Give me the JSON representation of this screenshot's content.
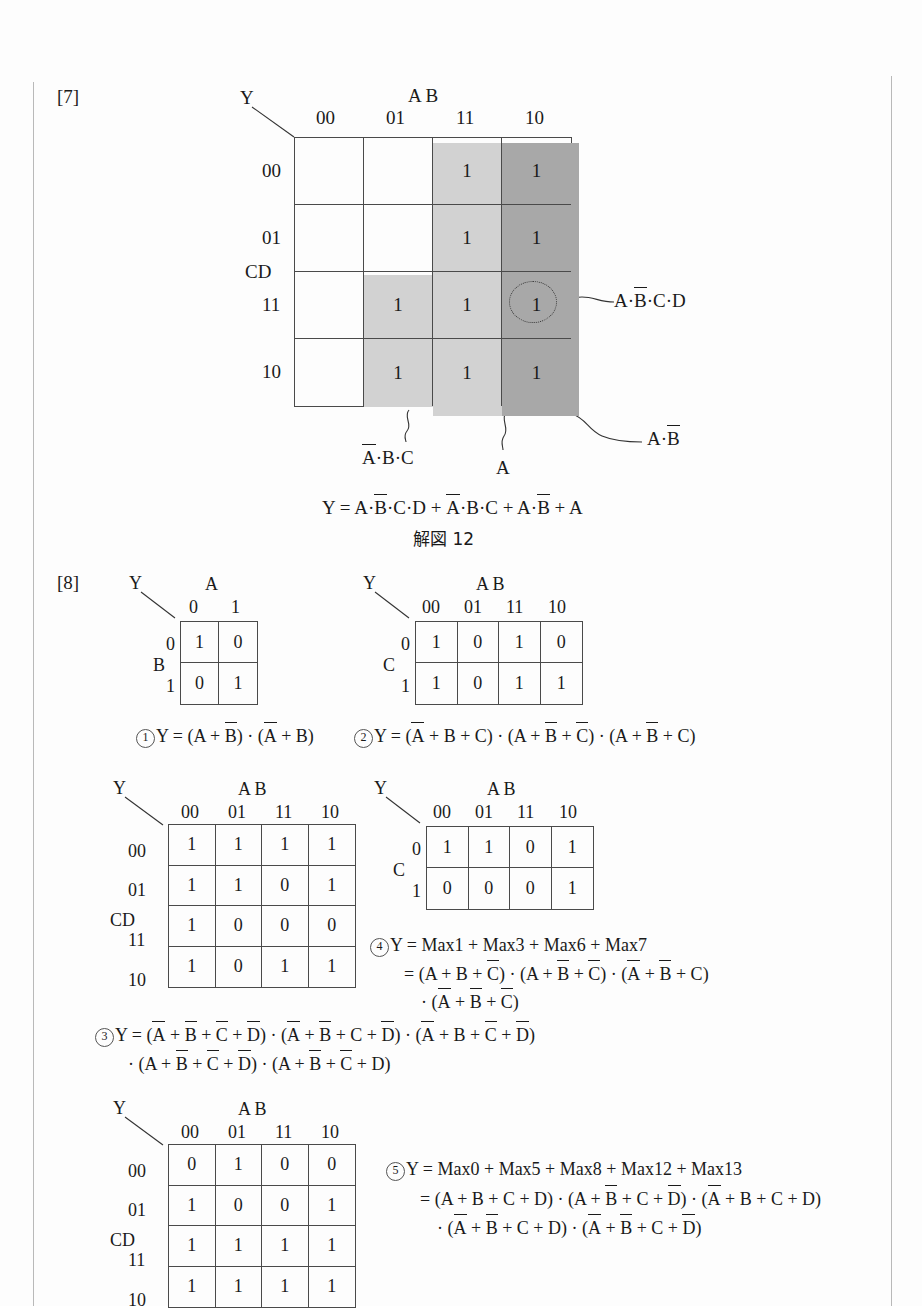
{
  "page": {
    "section7_tag": "[7]",
    "section8_tag": "[8]"
  },
  "map7": {
    "output_label": "Y",
    "col_group_label": "A B",
    "row_group_label": "CD",
    "col_headers": [
      "00",
      "01",
      "11",
      "10"
    ],
    "row_headers": [
      "00",
      "01",
      "11",
      "10"
    ],
    "cells": [
      [
        "",
        "",
        "1",
        "1"
      ],
      [
        "",
        "",
        "1",
        "1"
      ],
      [
        "",
        "1",
        "1",
        "1"
      ],
      [
        "",
        "1",
        "1",
        "1"
      ]
    ],
    "annotations": {
      "circled_term": "A·B̄·C·D",
      "a_bbar": "A·B̄",
      "abar_b_c": "Ā·B·C",
      "a": "A"
    },
    "result": "Y = A·B̄·C·D + Ā·B·C + A·B̄ + A",
    "caption": "解図 12"
  },
  "map1": {
    "output_label": "Y",
    "col_group_label": "A",
    "row_group_label": "B",
    "col_headers": [
      "0",
      "1"
    ],
    "row_headers": [
      "0",
      "1"
    ],
    "cells": [
      [
        "1",
        "0"
      ],
      [
        "0",
        "1"
      ]
    ],
    "number": "①",
    "equation": "Y = (A + B̄) · (Ā + B)"
  },
  "map2": {
    "output_label": "Y",
    "col_group_label": "A B",
    "row_group_label": "C",
    "col_headers": [
      "00",
      "01",
      "11",
      "10"
    ],
    "row_headers": [
      "0",
      "1"
    ],
    "cells": [
      [
        "1",
        "0",
        "1",
        "0"
      ],
      [
        "1",
        "0",
        "1",
        "1"
      ]
    ],
    "number": "②",
    "equation": "Y = (Ā + B + C) · (A + B̄ + C̄) · (A + B̄ + C)"
  },
  "map3": {
    "output_label": "Y",
    "col_group_label": "A B",
    "row_group_label": "CD",
    "col_headers": [
      "00",
      "01",
      "11",
      "10"
    ],
    "row_headers": [
      "00",
      "01",
      "11",
      "10"
    ],
    "cells": [
      [
        "1",
        "1",
        "1",
        "1"
      ],
      [
        "1",
        "1",
        "0",
        "1"
      ],
      [
        "1",
        "0",
        "0",
        "0"
      ],
      [
        "1",
        "0",
        "1",
        "1"
      ]
    ],
    "number": "③",
    "equation_line1": "Y = (Ā + B̄ + C̄ + D̄) · (Ā + B̄ + C + D̄) · (Ā + B + C̄ + D̄)",
    "equation_line2": "· (A + B̄ + C̄ + D̄) · (A + B̄ + C̄ + D)"
  },
  "map4": {
    "output_label": "Y",
    "col_group_label": "A B",
    "row_group_label": "C",
    "col_headers": [
      "00",
      "01",
      "11",
      "10"
    ],
    "row_headers": [
      "0",
      "1"
    ],
    "cells": [
      [
        "1",
        "1",
        "0",
        "1"
      ],
      [
        "0",
        "0",
        "0",
        "1"
      ]
    ],
    "number": "④",
    "equation_line1": "Y = Max1 + Max3 + Max6 + Max7",
    "equation_line2": "= (A + B + C̄) · (A + B̄ + C̄) · (Ā + B̄ + C)",
    "equation_line3": "· (Ā + B̄ + C̄)"
  },
  "map5": {
    "output_label": "Y",
    "col_group_label": "A B",
    "row_group_label": "CD",
    "col_headers": [
      "00",
      "01",
      "11",
      "10"
    ],
    "row_headers": [
      "00",
      "01",
      "11",
      "10"
    ],
    "cells": [
      [
        "0",
        "1",
        "0",
        "0"
      ],
      [
        "1",
        "0",
        "0",
        "1"
      ],
      [
        "1",
        "1",
        "1",
        "1"
      ],
      [
        "1",
        "1",
        "1",
        "1"
      ]
    ],
    "number": "⑤",
    "equation_line1": "Y = Max0 + Max5 + Max8 + Max12 + Max13",
    "equation_line2": "= (A + B + C + D) · (A + B̄ + C + D̄) · (Ā + B + C + D)",
    "equation_line3": "· (Ā + B̄ + C + D) · (Ā + B̄ + C + D̄)"
  },
  "colors": {
    "ink": "#1a1a1a",
    "grid_line": "#4a4a4a",
    "shade_light": "#d2d2d2",
    "shade_dark": "#a8a8a8",
    "page_rule": "#b9b9b9"
  }
}
